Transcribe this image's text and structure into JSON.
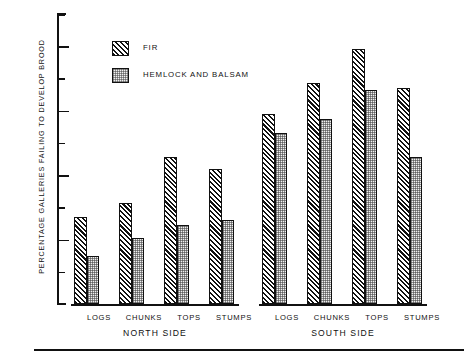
{
  "chart_data": {
    "type": "bar",
    "title": "",
    "xlabel": "",
    "ylabel": "PERCENTAGE GALLERIES FAILING TO DEVELOP BROOD",
    "ylim": [
      0,
      90
    ],
    "ytick_major": [
      20,
      40,
      60,
      80
    ],
    "ytick_minor": [
      10,
      30,
      50,
      70,
      90
    ],
    "ytick_labels": [
      "20",
      "40",
      "60",
      "80"
    ],
    "grid": false,
    "legend_position": "upper-left-inside",
    "categories": [
      "LOGS",
      "CHUNKS",
      "TOPS",
      "STUMPS"
    ],
    "groups": [
      {
        "name": "NORTH SIDE",
        "series": [
          {
            "name": "FIR",
            "values": [
              27,
              31.5,
              45.5,
              42
            ]
          },
          {
            "name": "HEMLOCK AND BALSAM",
            "values": [
              15,
              20.5,
              24.5,
              26
            ]
          }
        ]
      },
      {
        "name": "SOUTH SIDE",
        "series": [
          {
            "name": "FIR",
            "values": [
              59,
              68.5,
              79,
              67
            ]
          },
          {
            "name": "HEMLOCK AND BALSAM",
            "values": [
              53,
              57.5,
              66.5,
              45.5
            ]
          }
        ]
      }
    ],
    "legend": [
      {
        "label": "FIR",
        "pattern": "diagonal-hatch"
      },
      {
        "label": "HEMLOCK AND BALSAM",
        "pattern": "stipple"
      }
    ]
  },
  "axis": {
    "ylabel": "PERCENTAGE GALLERIES FAILING TO DEVELOP BROOD",
    "ticks": [
      "20",
      "40",
      "60",
      "80"
    ]
  },
  "legend": {
    "fir": "FIR",
    "hemlock": "HEMLOCK AND BALSAM"
  },
  "groups": {
    "north": "NORTH SIDE",
    "south": "SOUTH SIDE"
  },
  "categories": {
    "logs": "LOGS",
    "chunks": "CHUNKS",
    "tops": "TOPS",
    "stumps": "STUMPS"
  },
  "caption": ""
}
